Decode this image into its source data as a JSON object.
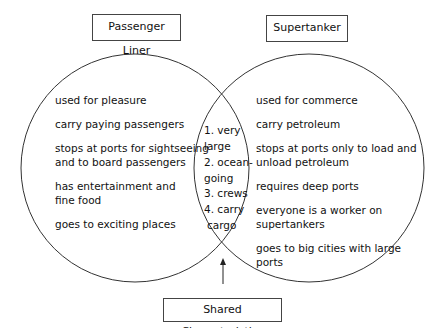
{
  "left": {
    "title": "Passenger Liner",
    "items": [
      "used for pleasure",
      "carry paying passengers",
      "stops at ports for sightseeing",
      "and to board passengers",
      "has entertainment and",
      "fine food",
      "goes to exciting places"
    ]
  },
  "right": {
    "title": "Supertanker",
    "items": [
      "used for commerce",
      "carry petroleum",
      "stops at ports only to load and",
      "unload petroleum",
      "requires deep ports",
      "everyone is a worker on",
      "supertankers",
      "goes to big cities with large",
      "ports"
    ]
  },
  "shared": {
    "label": "Shared Characteristics",
    "items": [
      "1. very",
      "large",
      "2. ocean-",
      "going",
      "3. crews",
      "4. carry",
      "cargo"
    ]
  }
}
